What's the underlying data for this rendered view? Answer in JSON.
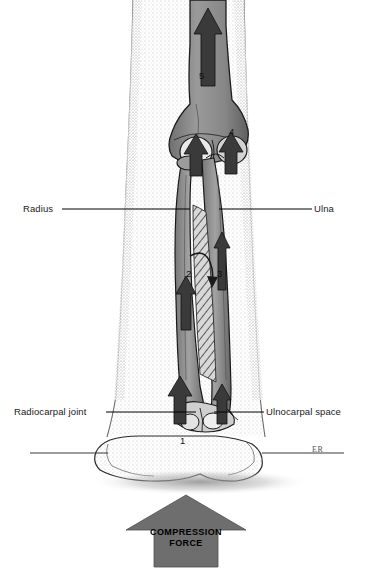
{
  "figure": {
    "signature": "ER"
  },
  "labels": {
    "radius": "Radius",
    "ulna": "Ulna",
    "radiocarpal_joint": "Radiocarpal joint",
    "ulnocarpal_space": "Ulnocarpal space"
  },
  "markers": {
    "one": "1",
    "two": "2",
    "three": "3",
    "four": "4",
    "five": "5"
  },
  "force_arrow": {
    "line1": "COMPRESSION",
    "line2": "FORCE",
    "color": "#6e6e6e"
  },
  "colors": {
    "bone_fill": "#8c8c8c",
    "bone_outline": "#1a1a1a",
    "arrow_dark": "#3a3a3a",
    "skin_outline": "#2b2b2b",
    "leader_line": "#000000",
    "ground_line": "#3a3a3a"
  }
}
